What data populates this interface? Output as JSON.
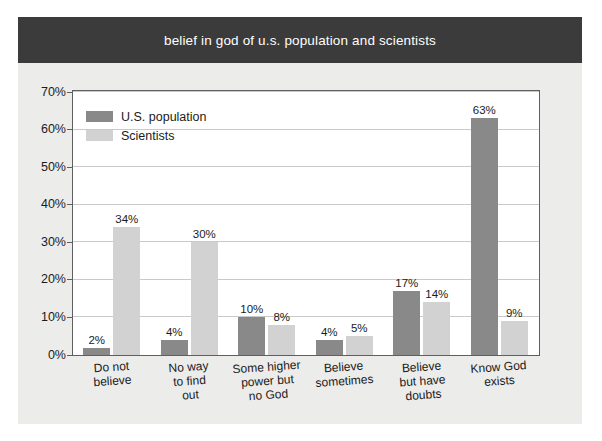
{
  "title": "belief in god of u.s. population and scientists",
  "colors": {
    "title_band": "#3b3b3b",
    "title_text": "#ffffff",
    "panel_background": "#ececeb",
    "plot_background": "#ffffff",
    "plot_border": "#5f5f5f",
    "gridline": "#c9c9c9",
    "series_population": "#898989",
    "series_scientists": "#d2d2d2",
    "text": "#1b1b1b"
  },
  "legend": {
    "position": "top-left-inside",
    "items": [
      {
        "label": "U.S. population",
        "color": "#898989",
        "swatch_name": "legend-swatch-population"
      },
      {
        "label": "Scientists",
        "color": "#d2d2d2",
        "swatch_name": "legend-swatch-scientists"
      }
    ]
  },
  "yaxis": {
    "ticks": [
      "0%",
      "10%",
      "20%",
      "30%",
      "40%",
      "50%",
      "60%",
      "70%"
    ],
    "tick_values": [
      0,
      10,
      20,
      30,
      40,
      50,
      60,
      70
    ],
    "min": 0,
    "max": 70
  },
  "chart_data": {
    "type": "bar",
    "title": "belief in god of u.s. population and scientists",
    "xlabel": "",
    "ylabel": "",
    "ylim": [
      0,
      70
    ],
    "grid": true,
    "legend_position": "top-left-inside",
    "categories": [
      "Do not believe",
      "No way to find out",
      "Some higher power but no God",
      "Believe sometimes",
      "Believe but have doubts",
      "Know God exists"
    ],
    "category_lines": [
      [
        "Do not",
        "believe"
      ],
      [
        "No way",
        "to find",
        "out"
      ],
      [
        "Some higher",
        "power but",
        "no God"
      ],
      [
        "Believe",
        "sometimes"
      ],
      [
        "Believe",
        "but have",
        "doubts"
      ],
      [
        "Know God",
        "exists"
      ]
    ],
    "series": [
      {
        "name": "U.S. population",
        "color": "#898989",
        "values": [
          2,
          4,
          10,
          4,
          17,
          63
        ],
        "labels": [
          "2%",
          "4%",
          "10%",
          "4%",
          "17%",
          "63%"
        ]
      },
      {
        "name": "Scientists",
        "color": "#d2d2d2",
        "values": [
          34,
          30,
          8,
          5,
          14,
          9
        ],
        "labels": [
          "34%",
          "30%",
          "8%",
          "5%",
          "14%",
          "9%"
        ]
      }
    ],
    "ytick_labels": [
      "0%",
      "10%",
      "20%",
      "30%",
      "40%",
      "50%",
      "60%",
      "70%"
    ]
  }
}
